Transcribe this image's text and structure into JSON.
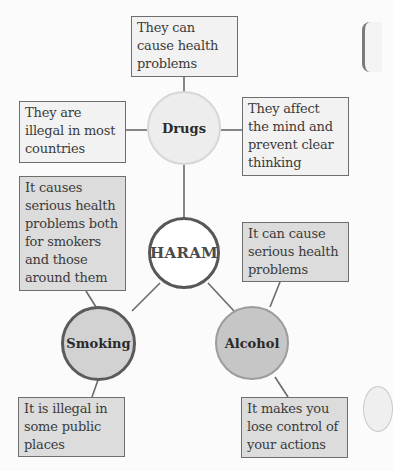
{
  "center": {
    "label": "HARAM"
  },
  "topics": [
    {
      "id": "drugs",
      "label": "Drugs",
      "facts": [
        "They can cause health problems",
        "They are illegal in most countries",
        "They affect the mind and prevent clear thinking"
      ]
    },
    {
      "id": "smoking",
      "label": "Smoking",
      "facts": [
        "It causes serious health problems both for smokers and those around them",
        "It is illegal in some public places"
      ]
    },
    {
      "id": "alcohol",
      "label": "Alcohol",
      "facts": [
        "It can cause serious health problems",
        "It makes you lose control of your actions"
      ]
    }
  ],
  "colors": {
    "line": "#6a6a6a",
    "box_border": "#6e6e6e",
    "box_light_fill": "#f2f2f2",
    "box_gray_fill": "#dcdcdc",
    "drugs_fill": "#ededed",
    "haram_border": "#575757",
    "smoking_fill": "#d2d2d2",
    "alcohol_fill": "#c6c6c6"
  }
}
